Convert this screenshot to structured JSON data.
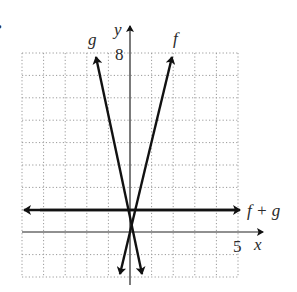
{
  "figure": {
    "marker": "•",
    "labels": {
      "f": "f",
      "g": "g",
      "sum": "f + g",
      "x_axis": "x",
      "y_axis": "y",
      "x_tick": "5",
      "y_tick": "8"
    }
  },
  "diagram_data": {
    "type": "line",
    "grid": {
      "x_range": [
        -5,
        5
      ],
      "y_range": [
        -2,
        8
      ],
      "step": 1,
      "style": "dotted"
    },
    "axes": {
      "x_label": "x",
      "y_label": "y",
      "x_tick_labeled": 5,
      "y_tick_labeled": 8
    },
    "series": [
      {
        "name": "f",
        "equation": "y = 4x",
        "approx_points": [
          [
            -0.5,
            -2
          ],
          [
            2,
            8
          ]
        ]
      },
      {
        "name": "g",
        "equation": "y = -4x + 1",
        "approx_points": [
          [
            0.75,
            -2
          ],
          [
            -1.75,
            8
          ]
        ]
      },
      {
        "name": "f + g",
        "equation": "y = 1",
        "approx_points": [
          [
            -5,
            1
          ],
          [
            5,
            1
          ]
        ]
      }
    ]
  }
}
